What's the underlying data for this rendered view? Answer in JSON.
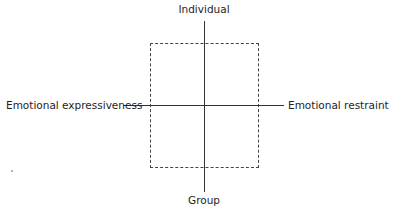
{
  "diagram": {
    "type": "quadrant",
    "axes": {
      "vertical": {
        "top_label": "Individual",
        "bottom_label": "Group"
      },
      "horizontal": {
        "left_label": "Emotional expressiveness",
        "right_label": "Emotional restraint"
      }
    },
    "region": {
      "style": "dashed-rectangle",
      "description": "central dashed box spanning all four quadrants"
    },
    "colors": {
      "line": "#333333",
      "text": "#1e1e1e",
      "background": "#ffffff"
    }
  }
}
